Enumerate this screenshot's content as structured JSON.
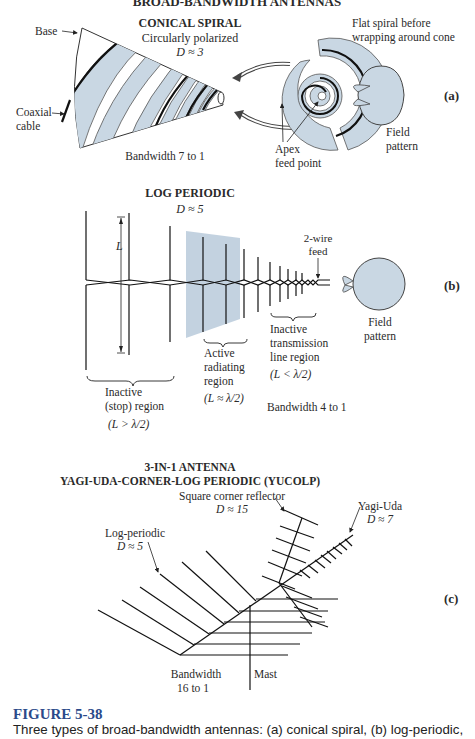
{
  "header": {
    "title": "BROAD-BANDWIDTH ANTENNAS"
  },
  "panel_a": {
    "id": "(a)",
    "title": "CONICAL SPIRAL",
    "subtitle": "Circularly polarized",
    "directivity": "D ≈ 3",
    "labels": {
      "base": "Base",
      "coaxial_1": "Coaxial",
      "coaxial_2": "cable",
      "flat_1": "Flat spiral before",
      "flat_2": "wrapping around cone",
      "apex_1": "Apex",
      "apex_2": "feed point",
      "field_1": "Field",
      "field_2": "pattern",
      "bandwidth": "Bandwidth 7 to 1"
    }
  },
  "panel_b": {
    "id": "(b)",
    "title": "LOG PERIODIC",
    "directivity": "D ≈ 5",
    "labels": {
      "L": "L",
      "feed_1": "2-wire",
      "feed_2": "feed",
      "field_1": "Field",
      "field_2": "pattern",
      "inactive_stop_1": "Inactive",
      "inactive_stop_2": "(stop) region",
      "inactive_stop_cond": "(L > λ/2)",
      "active_1": "Active",
      "active_2": "radiating",
      "active_3": "region",
      "active_cond": "(L ≈ λ/2)",
      "inactive_tl_1": "Inactive",
      "inactive_tl_2": "transmission",
      "inactive_tl_3": "line region",
      "inactive_tl_cond": "(L < λ/2)",
      "bandwidth": "Bandwidth 4 to 1"
    }
  },
  "panel_c": {
    "id": "(c)",
    "title_1": "3-IN-1 ANTENNA",
    "title_2": "YAGI-UDA-CORNER-LOG PERIODIC (YUCOLP)",
    "labels": {
      "corner_1": "Square corner reflector",
      "corner_2": "D ≈ 15",
      "yagi_1": "Yagi-Uda",
      "yagi_2": "D ≈ 7",
      "lp_1": "Log-periodic",
      "lp_2": "D ≈ 5",
      "bw_1": "Bandwidth",
      "bw_2": "16 to 1",
      "mast": "Mast"
    }
  },
  "caption": {
    "figure": "FIGURE 5-38",
    "text": "Three types of broad-bandwidth antennas: (a) conical spiral, (b) log-periodic,"
  },
  "colors": {
    "fill": "#c9d7e3",
    "shade": "#b8cadb",
    "caption": "#2b4a8a"
  }
}
